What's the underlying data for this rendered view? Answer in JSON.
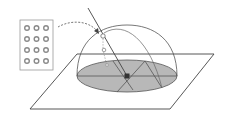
{
  "diagram": {
    "title": "Hemispherical sky dome over ground plane with sensor array",
    "elements": {
      "sensor_grid": {
        "rows": 4,
        "cols": 3,
        "label": "sensor-array"
      },
      "ground_plane": {
        "label": "ground-plane"
      },
      "horizon_disc": {
        "label": "horizon-disc",
        "fill": "#b5b5b5"
      },
      "sky_dome": {
        "label": "hemisphere"
      },
      "sun_ray": {
        "label": "incident-ray"
      },
      "center_point": {
        "label": "observer-point",
        "fill": "#333333"
      },
      "arrow": {
        "label": "dashed-arrow",
        "style": "dashed"
      }
    },
    "colors": {
      "stroke": "#444444",
      "disc_fill": "#b8b8b8",
      "grid_circle": "#8a8a8a",
      "background": "#ffffff"
    }
  }
}
